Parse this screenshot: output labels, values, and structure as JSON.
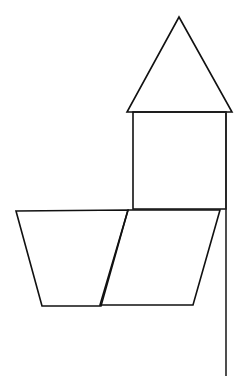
{
  "diagram": {
    "stroke_color": "#111111",
    "background": "#ffffff",
    "shapes": [
      {
        "name": "triangle",
        "points": [
          [
            179,
            17
          ],
          [
            232,
            112
          ],
          [
            127,
            112
          ]
        ]
      },
      {
        "name": "square",
        "points": [
          [
            133,
            112
          ],
          [
            226,
            112
          ],
          [
            226,
            209
          ],
          [
            133,
            209
          ]
        ]
      },
      {
        "name": "trapezoid",
        "points": [
          [
            16,
            211
          ],
          [
            128,
            210
          ],
          [
            101,
            306
          ],
          [
            42,
            306
          ]
        ]
      },
      {
        "name": "parallelogram",
        "points": [
          [
            128,
            210
          ],
          [
            220,
            210
          ],
          [
            193,
            305
          ],
          [
            100,
            305
          ]
        ]
      },
      {
        "name": "vertical-line",
        "points": [
          [
            226,
            112
          ],
          [
            226,
            376
          ]
        ]
      }
    ]
  }
}
